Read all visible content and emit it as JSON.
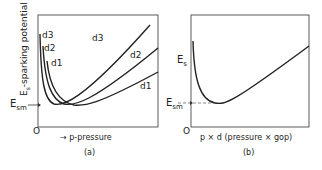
{
  "panel_a": {
    "caption": "(a)",
    "y_axis_label": "E",
    "y_axis_label_sub": "s",
    "y_axis_label_rest": "-sparking potential",
    "x_axis_label": "p-pressure",
    "x_axis_arrow": "→",
    "origin": "O",
    "esm_label": "E",
    "esm_sub": "sm",
    "curve_labels_left": [
      "d3",
      "d2",
      "d1"
    ],
    "curve_labels_right": [
      "d3",
      "d2",
      "d1"
    ]
  },
  "panel_b": {
    "caption": "(b)",
    "es_label": "E",
    "es_sub": "s",
    "esm_label": "E",
    "esm_sub": "sm",
    "origin": "O",
    "x_axis_label": "p × d (pressure × gop)"
  },
  "colors": {
    "line": "#222222",
    "background": "#ffffff"
  }
}
